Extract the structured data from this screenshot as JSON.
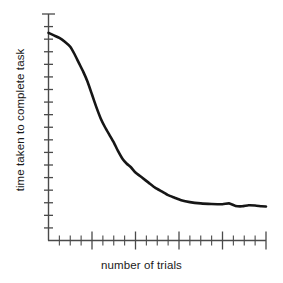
{
  "chart_data": {
    "type": "line",
    "title": "",
    "subtitle": "",
    "xlabel": "number of trials",
    "ylabel": "time taken to complete task",
    "grid": false,
    "legend": null,
    "legend_position": "none",
    "axis_ticks_labeled": false,
    "xlim": [
      0,
      20
    ],
    "ylim": [
      0,
      18
    ],
    "x_major_tick_every": 4,
    "x_minor_tick_count": 20,
    "y_tick_count": 18,
    "annotations": [],
    "series": [
      {
        "name": "time to complete task",
        "color": "#161616",
        "x": [
          0.0,
          0.5,
          1.0,
          1.5,
          2.0,
          2.4,
          2.8,
          3.2,
          3.6,
          4.0,
          4.4,
          4.8,
          5.2,
          5.6,
          6.0,
          6.4,
          6.8,
          7.2,
          7.6,
          8.0,
          8.6,
          9.2,
          9.8,
          10.4,
          11.0,
          11.6,
          12.2,
          13.0,
          14.0,
          15.0,
          16.0,
          16.6,
          17.2,
          17.8,
          18.4,
          19.0,
          19.6,
          20.0
        ],
        "y": [
          16.5,
          16.3,
          16.1,
          15.8,
          15.4,
          14.8,
          14.1,
          13.4,
          12.6,
          11.6,
          10.6,
          9.7,
          9.0,
          8.4,
          7.8,
          7.1,
          6.5,
          6.1,
          5.8,
          5.4,
          5.0,
          4.6,
          4.2,
          3.9,
          3.6,
          3.4,
          3.2,
          3.05,
          2.95,
          2.9,
          2.88,
          2.95,
          2.75,
          2.72,
          2.8,
          2.78,
          2.72,
          2.7
        ]
      }
    ]
  },
  "figure": {
    "background_color": "#ffffff",
    "axis_color": "#4a4a4a",
    "curve_color": "#161616"
  }
}
